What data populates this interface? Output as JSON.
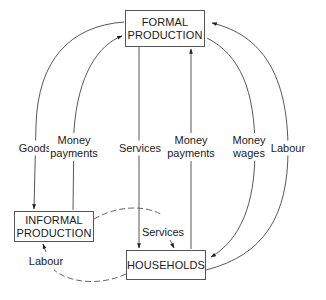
{
  "nodes": {
    "formal": {
      "line1": "FORMAL",
      "line2": "PRODUCTION"
    },
    "informal": {
      "line1": "INFORMAL",
      "line2": "PRODUCTION"
    },
    "households": {
      "label": "HOUSEHOLDS"
    }
  },
  "flows": {
    "goods": {
      "label": "Goods",
      "from": "FORMAL PRODUCTION",
      "to": "INFORMAL PRODUCTION",
      "style": "solid"
    },
    "money_payments_informal": {
      "line1": "Money",
      "line2": "payments",
      "from": "INFORMAL PRODUCTION",
      "to": "FORMAL PRODUCTION",
      "style": "solid"
    },
    "services_formal": {
      "label": "Services",
      "from": "FORMAL PRODUCTION",
      "to": "HOUSEHOLDS",
      "style": "solid"
    },
    "money_payments_households": {
      "line1": "Money",
      "line2": "payments",
      "from": "HOUSEHOLDS",
      "to": "FORMAL PRODUCTION",
      "style": "solid"
    },
    "money_wages": {
      "line1": "Money",
      "line2": "wages",
      "from": "FORMAL PRODUCTION",
      "to": "HOUSEHOLDS",
      "style": "solid"
    },
    "labour_formal": {
      "label": "Labour",
      "from": "HOUSEHOLDS",
      "to": "FORMAL PRODUCTION",
      "style": "solid"
    },
    "services_informal": {
      "label": "Services",
      "from": "INFORMAL PRODUCTION",
      "to": "HOUSEHOLDS",
      "style": "dashed"
    },
    "labour_informal": {
      "label": "Labour",
      "from": "HOUSEHOLDS",
      "to": "INFORMAL PRODUCTION",
      "style": "dashed"
    }
  }
}
